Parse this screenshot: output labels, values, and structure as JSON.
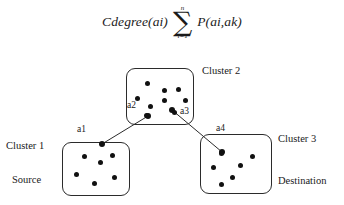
{
  "formula": {
    "lhs": "Cdegree(ai)",
    "sigma_upper": "n",
    "sigma_symbol": "∑",
    "sigma_lower": "i=1",
    "rhs": "P(ai,ak)"
  },
  "diagram": {
    "clusters": [
      {
        "id": "cluster-1",
        "title": "Cluster 1",
        "role": "Source",
        "box": {
          "x": 62,
          "y": 142,
          "w": 68,
          "h": 54
        },
        "title_pos": {
          "x": 6,
          "y": 140
        },
        "role_pos": {
          "x": 12,
          "y": 174
        },
        "dots": [
          {
            "x": 20,
            "y": 12
          },
          {
            "x": 36,
            "y": 18
          },
          {
            "x": 48,
            "y": 11
          },
          {
            "x": 12,
            "y": 30
          },
          {
            "x": 30,
            "y": 39
          },
          {
            "x": 50,
            "y": 33
          }
        ]
      },
      {
        "id": "cluster-2",
        "title": "Cluster 2",
        "role": "",
        "box": {
          "x": 126,
          "y": 68,
          "w": 68,
          "h": 57
        },
        "title_pos": {
          "x": 202,
          "y": 65
        },
        "role_pos": null,
        "dots": [
          {
            "x": 19,
            "y": 13
          },
          {
            "x": 36,
            "y": 20
          },
          {
            "x": 50,
            "y": 19
          },
          {
            "x": 9,
            "y": 28
          },
          {
            "x": 36,
            "y": 30
          },
          {
            "x": 57,
            "y": 30
          },
          {
            "x": 22,
            "y": 36
          },
          {
            "x": 18,
            "y": 45
          },
          {
            "x": 46,
            "y": 42
          }
        ]
      },
      {
        "id": "cluster-3",
        "title": "Cluster 3",
        "role": "Destination",
        "box": {
          "x": 200,
          "y": 134,
          "w": 72,
          "h": 60
        },
        "title_pos": {
          "x": 278,
          "y": 133
        },
        "role_pos": {
          "x": 278,
          "y": 175
        },
        "dots": [
          {
            "x": 19,
            "y": 17
          },
          {
            "x": 50,
            "y": 20
          },
          {
            "x": 11,
            "y": 31
          },
          {
            "x": 38,
            "y": 29
          },
          {
            "x": 30,
            "y": 41
          },
          {
            "x": 19,
            "y": 48
          }
        ]
      }
    ],
    "nodes": [
      {
        "id": "a1",
        "label": "a1",
        "x": 102,
        "y": 144,
        "label_pos": {
          "x": 77,
          "y": 124
        }
      },
      {
        "id": "a2",
        "label": "a2",
        "x": 148,
        "y": 116,
        "label_pos": {
          "x": 127,
          "y": 100
        }
      },
      {
        "id": "a3",
        "label": "a3",
        "x": 172,
        "y": 110,
        "label_pos": {
          "x": 180,
          "y": 106
        }
      },
      {
        "id": "a4",
        "label": "a4",
        "x": 222,
        "y": 152,
        "label_pos": {
          "x": 216,
          "y": 123
        }
      }
    ],
    "edges": [
      {
        "id": "edge-a1-a2",
        "from": "a1",
        "to": "a2"
      },
      {
        "id": "edge-a3-a4",
        "from": "a3",
        "to": "a4"
      }
    ],
    "colors": {
      "stroke": "#2b2b2b",
      "dot": "#111111",
      "text": "#1a1a1a",
      "background": "#ffffff"
    }
  }
}
